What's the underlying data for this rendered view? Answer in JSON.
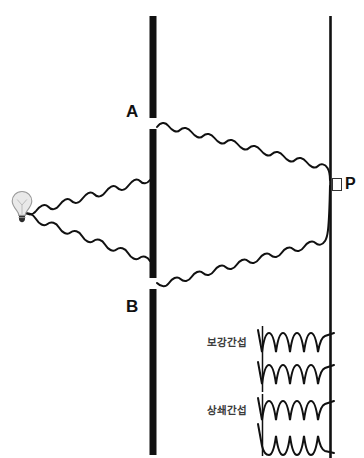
{
  "diagram": {
    "background_color": "#ffffff",
    "ink_color": "#111111"
  },
  "labels": {
    "slit_a": "A",
    "slit_b": "B",
    "point_p": "P",
    "point_p_marker": "□",
    "constructive": "보강간섭",
    "destructive": "상쇄간섭"
  },
  "icons": {
    "light_bulb": "light-bulb-icon"
  },
  "geometry": {
    "source": {
      "x": 22,
      "y": 207
    },
    "barrier": {
      "x": 153,
      "y_top": 16,
      "y_bottom": 455,
      "thickness": 7,
      "color": "#111111"
    },
    "slit_a": {
      "x": 153,
      "y": 123,
      "gap": 11
    },
    "slit_b": {
      "x": 153,
      "y": 283,
      "gap": 11
    },
    "screen": {
      "x": 330,
      "y_top": 16,
      "y_bottom": 458,
      "thickness": 2.6,
      "color": "#111111"
    },
    "point_p": {
      "x": 330,
      "y": 183
    }
  },
  "waves": {
    "stroke_color": "#111111",
    "stroke_width": 2.0,
    "paths": [
      {
        "name": "source-to-slit-a",
        "from": "source",
        "to": "slit_a"
      },
      {
        "name": "source-to-slit-b",
        "from": "source",
        "to": "slit_b"
      },
      {
        "name": "slit-a-to-point-p",
        "from": "slit_a",
        "to": "point_p"
      },
      {
        "name": "slit-b-to-point-p",
        "from": "slit_b",
        "to": "point_p"
      }
    ]
  },
  "insets": [
    {
      "name": "constructive-interference",
      "label": "보강간섭",
      "phase_relation": "in-phase",
      "wave_count": 2,
      "cycles": 3.5,
      "x_start": 262,
      "x_end": 328,
      "wave_rows_y": [
        343,
        375
      ],
      "amplitude": 14
    },
    {
      "name": "destructive-interference",
      "label": "상쇄간섭",
      "phase_relation": "out-of-phase",
      "wave_count": 2,
      "cycles": 3.5,
      "x_start": 262,
      "x_end": 328,
      "wave_rows_y": [
        411,
        440
      ],
      "amplitude": 14
    }
  ]
}
